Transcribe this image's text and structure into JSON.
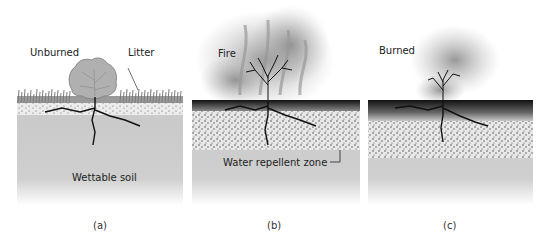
{
  "panels": [
    {
      "id": "a",
      "caption": "(a)",
      "state_label": "Unburned",
      "callouts": {
        "litter": "Litter",
        "soil": "Wettable soil"
      }
    },
    {
      "id": "b",
      "caption": "(b)",
      "state_label": "Fire",
      "callouts": {
        "zone": "Water repellent zone"
      }
    },
    {
      "id": "c",
      "caption": "(c)",
      "state_label": "Burned"
    }
  ],
  "colors": {
    "soil": "#c8c8c8",
    "dotted_layer_bg": "#e6e6e6",
    "burned_surface": "#1a1a1a",
    "grass": "#8a8a8a",
    "roots": "#111111",
    "smoke": "#9a9a9a"
  }
}
